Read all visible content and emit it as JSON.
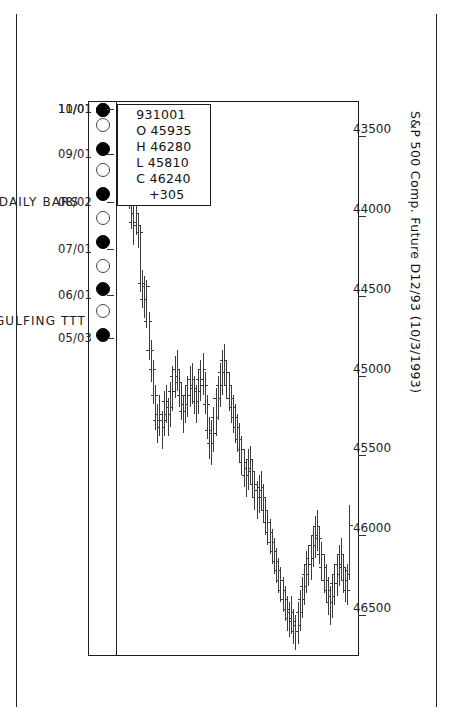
{
  "chart_data": {
    "type": "bar",
    "subtype": "ohlc-daily-bars",
    "title": "S&P 500 Comp. Future  D12/93 (10/3/1993)",
    "xlabel": "DAILY BARS",
    "ylabel": "",
    "footer_left": "ENGULFING TTT",
    "grid": false,
    "legend": "none",
    "orientation": "rotated-90",
    "ylim": [
      43300,
      46750
    ],
    "ytick_labels": [
      "46500",
      "46000",
      "45500",
      "45000",
      "44500",
      "44000",
      "43500"
    ],
    "ytick_values": [
      46500,
      46000,
      45500,
      45000,
      44500,
      44000,
      43500
    ],
    "xtick_labels": [
      "05/03",
      "06/01",
      "07/01",
      "08/02",
      "09/01",
      "10/01",
      "11/01"
    ],
    "xtick_index": [
      0,
      20,
      41,
      63,
      85,
      106,
      127
    ],
    "crosshair_date": "10/01",
    "crosshair_price": 46240,
    "moon_phases": [
      {
        "index": 2,
        "phase": "new"
      },
      {
        "index": 13,
        "phase": "full"
      },
      {
        "index": 23,
        "phase": "new"
      },
      {
        "index": 34,
        "phase": "full"
      },
      {
        "index": 45,
        "phase": "new"
      },
      {
        "index": 56,
        "phase": "full"
      },
      {
        "index": 67,
        "phase": "new"
      },
      {
        "index": 78,
        "phase": "full"
      },
      {
        "index": 88,
        "phase": "new"
      },
      {
        "index": 99,
        "phase": "full"
      },
      {
        "index": 110,
        "phase": "new"
      },
      {
        "index": 121,
        "phase": "full"
      },
      {
        "index": 131,
        "phase": "new"
      }
    ],
    "series_name": "D12/93",
    "columns": [
      "date",
      "open",
      "high",
      "low",
      "close"
    ],
    "bars": [
      [
        "930503",
        43580,
        43720,
        43480,
        43640
      ],
      [
        "930504",
        43640,
        43760,
        43520,
        43560
      ],
      [
        "930505",
        43560,
        43700,
        43440,
        43660
      ],
      [
        "930506",
        43660,
        43820,
        43600,
        43780
      ],
      [
        "930507",
        43780,
        43960,
        43740,
        43900
      ],
      [
        "930510",
        43900,
        44080,
        43860,
        44040
      ],
      [
        "930511",
        44040,
        44180,
        43940,
        43980
      ],
      [
        "930512",
        43980,
        44120,
        43860,
        44060
      ],
      [
        "930513",
        44060,
        44200,
        43980,
        44100
      ],
      [
        "930514",
        44100,
        44480,
        44060,
        44420
      ],
      [
        "930517",
        44420,
        44580,
        44340,
        44520
      ],
      [
        "930518",
        44520,
        44640,
        44380,
        44440
      ],
      [
        "930519",
        44440,
        44700,
        44400,
        44660
      ],
      [
        "930520",
        44660,
        44900,
        44600,
        44840
      ],
      [
        "930521",
        44840,
        45040,
        44780,
        44960
      ],
      [
        "930524",
        44960,
        45180,
        44900,
        45120
      ],
      [
        "930525",
        45120,
        45340,
        45060,
        45280
      ],
      [
        "930526",
        45280,
        45420,
        45180,
        45240
      ],
      [
        "930527",
        45240,
        45380,
        45120,
        45320
      ],
      [
        "930528",
        45320,
        45460,
        45220,
        45280
      ],
      [
        "930601",
        45280,
        45380,
        45100,
        45160
      ],
      [
        "930602",
        45160,
        45300,
        45060,
        45240
      ],
      [
        "930603",
        45240,
        45380,
        45140,
        45200
      ],
      [
        "930604",
        45200,
        45320,
        45040,
        45100
      ],
      [
        "930607",
        45100,
        45220,
        44940,
        45000
      ],
      [
        "930608",
        45000,
        45140,
        44880,
        44960
      ],
      [
        "930609",
        44960,
        45100,
        44840,
        45040
      ],
      [
        "930610",
        45040,
        45200,
        44960,
        45120
      ],
      [
        "930611",
        45120,
        45280,
        45040,
        45220
      ],
      [
        "930614",
        45220,
        45360,
        45120,
        45180
      ],
      [
        "930615",
        45180,
        45300,
        45060,
        45120
      ],
      [
        "930616",
        45120,
        45260,
        45000,
        45060
      ],
      [
        "930617",
        45060,
        45200,
        44940,
        45020
      ],
      [
        "930618",
        45020,
        45180,
        44920,
        45080
      ],
      [
        "930621",
        45080,
        45240,
        45000,
        45160
      ],
      [
        "930622",
        45160,
        45300,
        45060,
        45100
      ],
      [
        "930623",
        45100,
        45240,
        44960,
        45020
      ],
      [
        "930624",
        45020,
        45160,
        44900,
        44960
      ],
      [
        "930625",
        44960,
        45120,
        44860,
        45060
      ],
      [
        "930628",
        45060,
        45240,
        44980,
        45180
      ],
      [
        "930629",
        45180,
        45400,
        45120,
        45340
      ],
      [
        "930630",
        45340,
        45520,
        45260,
        45420
      ],
      [
        "930701",
        45420,
        45560,
        45280,
        45360
      ],
      [
        "930702",
        45360,
        45480,
        45200,
        45260
      ],
      [
        "930706",
        45260,
        45380,
        45080,
        45140
      ],
      [
        "930707",
        45140,
        45280,
        45000,
        45060
      ],
      [
        "930708",
        45060,
        45200,
        44920,
        44980
      ],
      [
        "930709",
        44980,
        45120,
        44840,
        44900
      ],
      [
        "930712",
        44900,
        45060,
        44800,
        44980
      ],
      [
        "930713",
        44980,
        45140,
        44900,
        45060
      ],
      [
        "930714",
        45060,
        45220,
        44980,
        45140
      ],
      [
        "930715",
        45140,
        45300,
        45060,
        45200
      ],
      [
        "930716",
        45200,
        45360,
        45120,
        45260
      ],
      [
        "930719",
        45260,
        45420,
        45180,
        45320
      ],
      [
        "930720",
        45320,
        45480,
        45240,
        45400
      ],
      [
        "930721",
        45400,
        45540,
        45300,
        45460
      ],
      [
        "930722",
        45460,
        45620,
        45380,
        45540
      ],
      [
        "930723",
        45540,
        45700,
        45460,
        45620
      ],
      [
        "930726",
        45620,
        45760,
        45520,
        45580
      ],
      [
        "930727",
        45580,
        45720,
        45460,
        45520
      ],
      [
        "930728",
        45520,
        45680,
        45440,
        45600
      ],
      [
        "930729",
        45600,
        45760,
        45520,
        45680
      ],
      [
        "930730",
        45680,
        45840,
        45600,
        45760
      ],
      [
        "930802",
        45760,
        45900,
        45660,
        45720
      ],
      [
        "930803",
        45720,
        45860,
        45620,
        45700
      ],
      [
        "930804",
        45700,
        45840,
        45600,
        45760
      ],
      [
        "930805",
        45760,
        45920,
        45680,
        45840
      ],
      [
        "930806",
        45840,
        46000,
        45760,
        45920
      ],
      [
        "930809",
        45920,
        46060,
        45840,
        45980
      ],
      [
        "930810",
        45980,
        46120,
        45900,
        46040
      ],
      [
        "930811",
        46040,
        46180,
        45960,
        46100
      ],
      [
        "930812",
        46100,
        46240,
        46020,
        46160
      ],
      [
        "930813",
        46160,
        46300,
        46080,
        46220
      ],
      [
        "930816",
        46220,
        46360,
        46140,
        46280
      ],
      [
        "930817",
        46280,
        46420,
        46200,
        46340
      ],
      [
        "930818",
        46340,
        46480,
        46260,
        46400
      ],
      [
        "930819",
        46400,
        46540,
        46320,
        46460
      ],
      [
        "930820",
        46460,
        46600,
        46380,
        46520
      ],
      [
        "930823",
        46520,
        46640,
        46420,
        46480
      ],
      [
        "930824",
        46480,
        46620,
        46380,
        46540
      ],
      [
        "930825",
        46540,
        46680,
        46460,
        46600
      ],
      [
        "930826",
        46600,
        46720,
        46500,
        46560
      ],
      [
        "930827",
        46560,
        46680,
        46420,
        46480
      ],
      [
        "930830",
        46480,
        46600,
        46340,
        46400
      ],
      [
        "930831",
        46400,
        46520,
        46260,
        46320
      ],
      [
        "930901",
        46320,
        46440,
        46180,
        46240
      ],
      [
        "930902",
        46240,
        46360,
        46100,
        46180
      ],
      [
        "930903",
        46180,
        46320,
        46060,
        46140
      ],
      [
        "930907",
        46140,
        46280,
        46000,
        46060
      ],
      [
        "930908",
        46060,
        46200,
        45940,
        46000
      ],
      [
        "930909",
        46000,
        46140,
        45880,
        45940
      ],
      [
        "930910",
        45940,
        46100,
        45840,
        46020
      ],
      [
        "930913",
        46020,
        46180,
        45940,
        46120
      ],
      [
        "930914",
        46120,
        46280,
        46040,
        46200
      ],
      [
        "930915",
        46200,
        46360,
        46120,
        46280
      ],
      [
        "930916",
        46280,
        46420,
        46180,
        46340
      ],
      [
        "930917",
        46340,
        46500,
        46260,
        46420
      ],
      [
        "930920",
        46420,
        46560,
        46320,
        46380
      ],
      [
        "930921",
        46380,
        46520,
        46240,
        46300
      ],
      [
        "930922",
        46300,
        46440,
        46180,
        46240
      ],
      [
        "930923",
        46240,
        46380,
        46120,
        46180
      ],
      [
        "930924",
        46180,
        46320,
        46060,
        46120
      ],
      [
        "930927",
        46120,
        46280,
        46020,
        46200
      ],
      [
        "930928",
        46200,
        46360,
        46120,
        46280
      ],
      [
        "930929",
        46280,
        46420,
        46200,
        46340
      ],
      [
        "930930",
        46340,
        46440,
        46180,
        46220
      ],
      [
        "931001",
        45935,
        46280,
        45810,
        46240
      ]
    ]
  },
  "window": {
    "title": "S&P 500 Comp. Future  D12/93 (10/3/1993)"
  },
  "chart": {
    "title": "S&P 500 Comp. Future  D12/93 (10/3/1993)",
    "caption_bars": "DAILY BARS",
    "caption_pattern": "ENGULFING TTT"
  },
  "quote_box": {
    "date": "931001",
    "open_label": "O",
    "open": "45935",
    "high_label": "H",
    "high": "46280",
    "low_label": "L",
    "low": "45810",
    "close_label": "C",
    "close": "46240",
    "change": "+305",
    "text": "931001\nO 45935\nH 46280\nL 45810\nC 46240\n   +305"
  },
  "colors": {
    "ink": "#1c1c1c",
    "bar": "#3a3a3a",
    "moon_new": "#000000",
    "moon_full": "#ffffff",
    "paper": "#ffffff"
  }
}
